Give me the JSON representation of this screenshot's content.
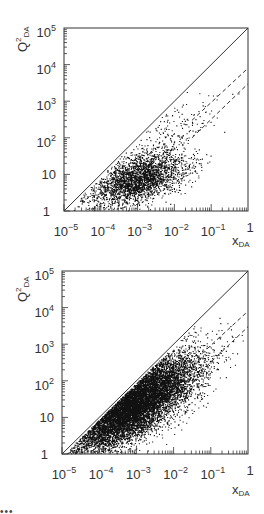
{
  "chart_data": [
    {
      "type": "scatter",
      "title": "",
      "xlabel": "x_DA",
      "ylabel": "Q²_DA",
      "xscale": "log",
      "yscale": "log",
      "xlim": [
        1e-05,
        1
      ],
      "ylim": [
        1,
        100000
      ],
      "x_tick_labels": [
        "10⁻⁵",
        "10⁻⁴",
        "10⁻³",
        "10⁻²",
        "10⁻¹",
        "1"
      ],
      "y_tick_labels": [
        "1",
        "10",
        "10²",
        "10³",
        "10⁴",
        "10⁵"
      ],
      "grid": false,
      "legend": null,
      "kinematic_limit_line": {
        "style": "solid",
        "from": [
          1e-05,
          1
        ],
        "to": [
          1,
          100000
        ]
      },
      "dashed_lines": [
        {
          "style": "dashed",
          "from": [
            0.03,
            300
          ],
          "to": [
            1,
            8000
          ]
        },
        {
          "style": "dashed",
          "from": [
            0.03,
            100
          ],
          "to": [
            1,
            3000
          ]
        }
      ],
      "density_description": "moderate density; core cluster around x≈1e-4–1e-2, Q²≈3–30; sparse tail up to Q²≈3000 near x≈0.1",
      "approx_point_count": 3000
    },
    {
      "type": "scatter",
      "title": "",
      "xlabel": "x_DA",
      "ylabel": "Q²_DA",
      "xscale": "log",
      "yscale": "log",
      "xlim": [
        1e-05,
        1
      ],
      "ylim": [
        1,
        100000
      ],
      "x_tick_labels": [
        "10⁻⁵",
        "10⁻⁴",
        "10⁻³",
        "10⁻²",
        "10⁻¹",
        "1"
      ],
      "y_tick_labels": [
        "1",
        "10",
        "10²",
        "10³",
        "10⁴",
        "10⁵"
      ],
      "grid": false,
      "legend": null,
      "kinematic_limit_line": {
        "style": "solid",
        "from": [
          1e-05,
          1
        ],
        "to": [
          1,
          100000
        ]
      },
      "dashed_lines": [
        {
          "style": "dashed",
          "from": [
            0.03,
            300
          ],
          "to": [
            1,
            8000
          ]
        },
        {
          "style": "dashed",
          "from": [
            0.03,
            100
          ],
          "to": [
            1,
            3000
          ]
        }
      ],
      "density_description": "high density; band filling region below the diagonal from x≈2e-5 to x≈0.05, Q² from 1 to ~1000; sparse points up to Q²≈10⁴",
      "approx_point_count": 12000
    }
  ],
  "panels": [
    {
      "ylabel_main": "Q",
      "ylabel_sup": "2",
      "ylabel_sub": "DA",
      "xlabel_main": "x",
      "xlabel_sub": "DA",
      "yticks": [
        {
          "base": "1",
          "exp": ""
        },
        {
          "base": "10",
          "exp": ""
        },
        {
          "base": "10",
          "exp": "2"
        },
        {
          "base": "10",
          "exp": "3"
        },
        {
          "base": "10",
          "exp": "4"
        },
        {
          "base": "10",
          "exp": "5"
        }
      ],
      "xticks": [
        {
          "base": "10",
          "exp": "-5"
        },
        {
          "base": "10",
          "exp": "-4"
        },
        {
          "base": "10",
          "exp": "-3"
        },
        {
          "base": "10",
          "exp": "-2"
        },
        {
          "base": "10",
          "exp": "-1"
        },
        {
          "base": "1",
          "exp": ""
        }
      ]
    },
    {
      "ylabel_main": "Q",
      "ylabel_sup": "2",
      "ylabel_sub": "DA",
      "xlabel_main": "x",
      "xlabel_sub": "DA",
      "yticks": [
        {
          "base": "1",
          "exp": ""
        },
        {
          "base": "10",
          "exp": ""
        },
        {
          "base": "10",
          "exp": "2"
        },
        {
          "base": "10",
          "exp": "3"
        },
        {
          "base": "10",
          "exp": "4"
        },
        {
          "base": "10",
          "exp": "5"
        }
      ],
      "xticks": [
        {
          "base": "10",
          "exp": "-5"
        },
        {
          "base": "10",
          "exp": "-4"
        },
        {
          "base": "10",
          "exp": "-3"
        },
        {
          "base": "10",
          "exp": "-2"
        },
        {
          "base": "10",
          "exp": "-1"
        },
        {
          "base": "1",
          "exp": ""
        }
      ]
    }
  ],
  "colors": {
    "axis": "#333333",
    "points": "#111111",
    "background": "#ffffff"
  }
}
